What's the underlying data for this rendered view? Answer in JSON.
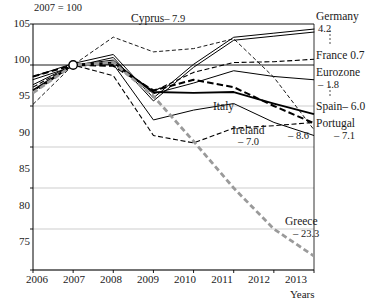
{
  "chart_data": {
    "type": "line",
    "title": "",
    "note": "2007 = 100",
    "xlabel": "Years",
    "ylabel": "",
    "x": [
      2006,
      2007,
      2008,
      2009,
      2010,
      2011,
      2012,
      2013
    ],
    "categories": [
      "2006",
      "2007",
      "2008",
      "2009",
      "2010",
      "2011",
      "2012",
      "2013"
    ],
    "xlim": [
      2006,
      2013
    ],
    "ylim": [
      75,
      105
    ],
    "yticks": [
      75,
      80,
      85,
      90,
      95,
      100,
      105
    ],
    "xticks": [
      "2006",
      "2007",
      "2008",
      "2009",
      "2010",
      "2011",
      "2012",
      "2013"
    ],
    "grid": "horizontal",
    "legend": "right-inline-labels",
    "series": [
      {
        "name": "Germany",
        "end_label": "Germany",
        "end_value": "4.2",
        "style": "double-line",
        "values": [
          98.4,
          100.0,
          101.1,
          95.8,
          99.9,
          103.2,
          103.7,
          104.2
        ]
      },
      {
        "name": "France",
        "end_label": "France",
        "end_value": "0.7",
        "style": "dashed",
        "values": [
          97.3,
          100.0,
          100.1,
          96.8,
          99.1,
          100.3,
          100.4,
          100.7
        ]
      },
      {
        "name": "Eurozone",
        "end_label": "Eurozone",
        "end_value": "-1.8",
        "style": "solid-thin",
        "values": [
          97.6,
          100.0,
          100.6,
          96.5,
          97.8,
          99.3,
          98.6,
          98.2
        ]
      },
      {
        "name": "Spain",
        "end_label": "Spain",
        "end_value": "-6.0",
        "style": "solid-thick",
        "values": [
          96.9,
          100.0,
          100.3,
          96.7,
          96.6,
          96.7,
          95.3,
          94.0
        ]
      },
      {
        "name": "Portugal",
        "end_label": "Portugal",
        "end_value": "-7.1",
        "style": "dashed-thick",
        "values": [
          98.6,
          100.0,
          99.9,
          96.9,
          98.2,
          97.3,
          95.0,
          92.9
        ]
      },
      {
        "name": "Italy",
        "end_label": "Italy",
        "end_value": "-8.6",
        "style": "solid-thin",
        "values": [
          96.8,
          100.0,
          100.1,
          93.3,
          94.5,
          95.3,
          93.0,
          91.4
        ]
      },
      {
        "name": "Ireland",
        "end_label": "Ireland",
        "end_value": "-7.0",
        "style": "dashed",
        "values": [
          96.6,
          100.0,
          98.7,
          91.4,
          90.5,
          92.3,
          92.6,
          93.0
        ]
      },
      {
        "name": "Cyprus",
        "end_label": "Cyprus",
        "end_value": "-7.9",
        "style": "dashed-thin",
        "values": [
          95.2,
          100.0,
          103.4,
          101.6,
          102.0,
          103.2,
          98.5,
          92.1
        ]
      },
      {
        "name": "Greece",
        "end_label": "Greece",
        "end_value": "-23.3",
        "style": "dashed-grey-thick",
        "values": [
          96.6,
          100.0,
          100.3,
          96.2,
          90.7,
          85.0,
          80.0,
          76.7
        ]
      }
    ],
    "annotations": [
      {
        "text": "Cyprus",
        "value": "-7.9",
        "position": "inside-top"
      },
      {
        "text": "Italy",
        "value": "",
        "position": "inside-middle"
      },
      {
        "text": "Ireland",
        "value": "-7.0",
        "position": "inside-middle"
      },
      {
        "text": "Greece",
        "value": "-23.3",
        "position": "inside-bottom"
      },
      {
        "text": "Germany",
        "value": "4.2",
        "position": "right"
      },
      {
        "text": "France 0.7",
        "value": "",
        "position": "right"
      },
      {
        "text": "Eurozone",
        "value": "-1.8",
        "position": "right"
      },
      {
        "text": "Spain-6.0",
        "value": "",
        "position": "right"
      },
      {
        "text": "Portugal",
        "value": "-7.1",
        "position": "right"
      }
    ]
  },
  "axis": {
    "y_tick_labels": [
      "105",
      "100",
      "95",
      "90",
      "85",
      "80",
      "75"
    ],
    "x_tick_labels": [
      "2006",
      "2007",
      "2008",
      "2009",
      "2010",
      "2011",
      "2012",
      "2013"
    ],
    "x_axis_title": "Years",
    "note": "2007 = 100"
  },
  "labels": {
    "germany_name": "Germany",
    "germany_value": "4.2",
    "france_name": "France 0.7",
    "eurozone_name": "Eurozone",
    "eurozone_value": "– 1.8",
    "spain_name": "Spain– 6.0",
    "portugal_name": "Portugal",
    "portugal_value": "– 7.1",
    "italy_name": "Italy",
    "italy_value": "– 8.6",
    "ireland_name": "Ireland",
    "ireland_value": "– 7.0",
    "greece_name": "Greece",
    "greece_value": "– 23.3",
    "cyprus_name": "Cyprus",
    "cyprus_value": "– 7.9"
  },
  "colors": {
    "axis": "#000000",
    "grid": "#b8b8b8",
    "series_dark": "#000000",
    "series_grey": "#9a9a9a",
    "background": "#ffffff"
  }
}
